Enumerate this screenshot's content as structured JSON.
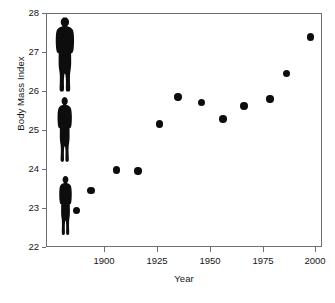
{
  "chart_data": {
    "type": "scatter",
    "title": "",
    "xlabel": "Year",
    "ylabel": "Body Mass Index",
    "xlim": [
      1885,
      2002
    ],
    "ylim": [
      22,
      28
    ],
    "xticks": [
      1900,
      1925,
      1950,
      1975,
      2000
    ],
    "xtick_labels": [
      "1900",
      "1925",
      "1950",
      "1975",
      "2000"
    ],
    "yticks": [
      22,
      23,
      24,
      25,
      26,
      27,
      28
    ],
    "ytick_labels": [
      "22",
      "23",
      "24",
      "25",
      "26",
      "27",
      "28"
    ],
    "grid": false,
    "legend": null,
    "marker": "filled-circle",
    "marker_color": "#0d0d0d",
    "frame_color": "#6d6f71",
    "background_color": "#ffffff",
    "x": [
      1898,
      1904,
      1915,
      1924,
      1933,
      1941,
      1951,
      1960,
      1969,
      1980,
      1987,
      1997
    ],
    "y": [
      22.93,
      23.45,
      23.97,
      23.95,
      25.15,
      25.85,
      25.7,
      25.28,
      25.62,
      25.8,
      26.45,
      27.38
    ],
    "series": [
      {
        "name": "Body Mass Index",
        "points": [
          {
            "x": 1898,
            "y": 22.93
          },
          {
            "x": 1904,
            "y": 23.45
          },
          {
            "x": 1915,
            "y": 23.97
          },
          {
            "x": 1924,
            "y": 23.95
          },
          {
            "x": 1933,
            "y": 25.15
          },
          {
            "x": 1941,
            "y": 25.85
          },
          {
            "x": 1951,
            "y": 25.7
          },
          {
            "x": 1960,
            "y": 25.28
          },
          {
            "x": 1969,
            "y": 25.62
          },
          {
            "x": 1980,
            "y": 25.8
          },
          {
            "x": 1987,
            "y": 26.45
          },
          {
            "x": 1997,
            "y": 27.38
          }
        ]
      }
    ],
    "annotations": [
      {
        "name": "human-silhouette-heavy",
        "bmi": 27.1,
        "build": "heavy",
        "description": "Black human silhouette icon with broad build placed at approximately BMI 27"
      },
      {
        "name": "human-silhouette-medium",
        "bmi": 25.1,
        "build": "medium",
        "description": "Black human silhouette icon with average build placed at approximately BMI 25"
      },
      {
        "name": "human-silhouette-slim",
        "bmi": 23.0,
        "build": "slim",
        "description": "Black human silhouette icon with slim build placed at approximately BMI 23"
      }
    ]
  }
}
